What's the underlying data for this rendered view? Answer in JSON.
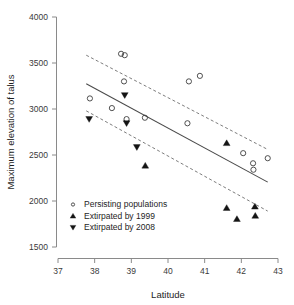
{
  "chart_data": {
    "type": "scatter",
    "title": "",
    "xlabel": "Latitude",
    "ylabel": "Maximum elevation of talus",
    "xlim": [
      37,
      43
    ],
    "ylim": [
      1500,
      4000
    ],
    "xticks": [
      37,
      38,
      39,
      40,
      41,
      42,
      43
    ],
    "yticks": [
      1500,
      2000,
      2500,
      3000,
      3500,
      4000
    ],
    "xtick_labels": [
      "37",
      "38",
      "39",
      "40",
      "41",
      "42",
      "43"
    ],
    "ytick_labels": [
      "1500",
      "2000",
      "2500",
      "3000",
      "3500",
      "4000"
    ],
    "grid": false,
    "legend_position": "lower-left",
    "series": [
      {
        "name": "Persisting populations",
        "marker": "open-circle",
        "points": [
          {
            "x": 37.87,
            "y": 3115
          },
          {
            "x": 38.47,
            "y": 3010
          },
          {
            "x": 38.72,
            "y": 3600
          },
          {
            "x": 38.82,
            "y": 3585
          },
          {
            "x": 38.8,
            "y": 3300
          },
          {
            "x": 38.87,
            "y": 2890
          },
          {
            "x": 39.37,
            "y": 2905
          },
          {
            "x": 40.53,
            "y": 2845
          },
          {
            "x": 40.57,
            "y": 3300
          },
          {
            "x": 40.87,
            "y": 3360
          },
          {
            "x": 42.05,
            "y": 2520
          },
          {
            "x": 42.32,
            "y": 2410
          },
          {
            "x": 42.33,
            "y": 2340
          },
          {
            "x": 42.72,
            "y": 2465
          }
        ]
      },
      {
        "name": "Extirpated by 1999",
        "marker": "filled-up-triangle",
        "points": [
          {
            "x": 39.38,
            "y": 2385
          },
          {
            "x": 41.6,
            "y": 2630
          },
          {
            "x": 41.6,
            "y": 1925
          },
          {
            "x": 41.88,
            "y": 1805
          },
          {
            "x": 42.37,
            "y": 1940
          },
          {
            "x": 42.38,
            "y": 1840
          }
        ]
      },
      {
        "name": "Extirpated by 2008",
        "marker": "filled-down-triangle",
        "points": [
          {
            "x": 37.85,
            "y": 2890
          },
          {
            "x": 38.82,
            "y": 3150
          },
          {
            "x": 38.87,
            "y": 2845
          },
          {
            "x": 39.15,
            "y": 2585
          }
        ]
      }
    ],
    "fit_line": {
      "style": "solid",
      "x_start": 37.77,
      "y_start": 3275,
      "x_end": 42.72,
      "y_end": 2205
    },
    "confidence_band_upper": {
      "style": "dashed",
      "x_start": 37.77,
      "y_start": 3585,
      "x_end": 42.72,
      "y_end": 2560
    },
    "confidence_band_lower": {
      "style": "dashed",
      "x_start": 37.77,
      "y_start": 2980,
      "x_end": 42.72,
      "y_end": 1890
    }
  },
  "legend": {
    "items": [
      {
        "label": "Persisting populations",
        "marker": "open-circle"
      },
      {
        "label": "Extirpated by 1999",
        "marker": "filled-up-triangle"
      },
      {
        "label": "Extirpated by 2008",
        "marker": "filled-down-triangle"
      }
    ]
  }
}
